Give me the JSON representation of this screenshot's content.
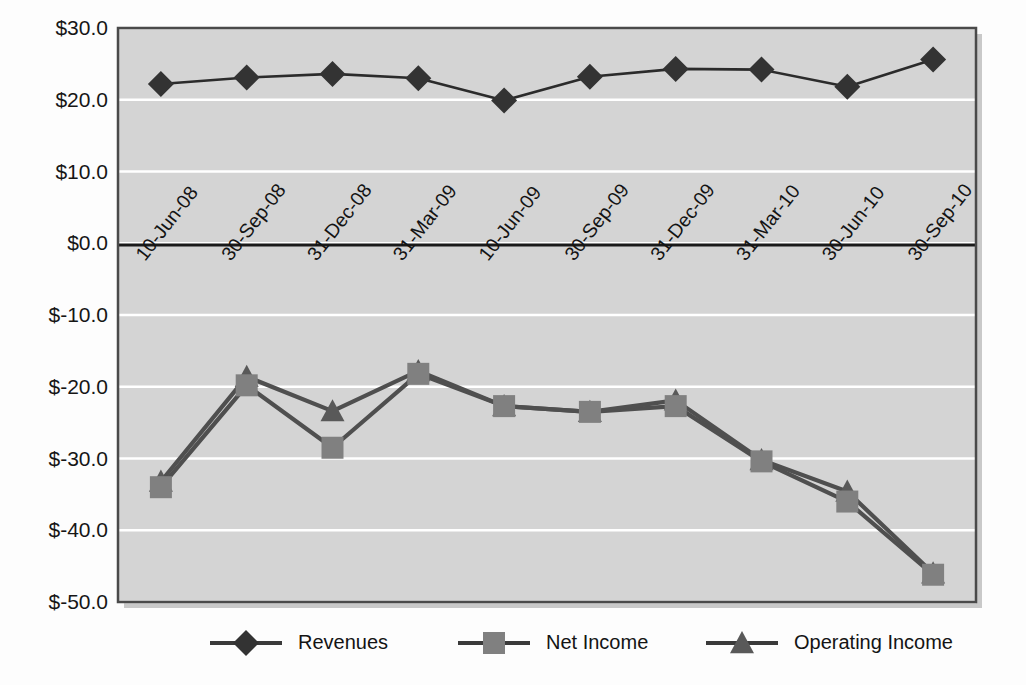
{
  "chart_data": {
    "type": "line",
    "title": "",
    "subtitle": "",
    "xlabel": "",
    "ylabel": "",
    "categories": [
      "10-Jun-08",
      "30-Sep-08",
      "31-Dec-08",
      "31-Mar-09",
      "10-Jun-09",
      "30-Sep-09",
      "31-Dec-09",
      "31-Mar-10",
      "30-Jun-10",
      "30-Sep-10"
    ],
    "series": [
      {
        "name": "Revenues",
        "marker": "diamond",
        "color": "#333333",
        "values": [
          22.2,
          23.1,
          23.6,
          23.0,
          19.9,
          23.2,
          24.3,
          24.2,
          21.8,
          25.6
        ]
      },
      {
        "name": "Net Income",
        "marker": "square",
        "color": "#808080",
        "values": [
          -34.0,
          -19.8,
          -28.5,
          -18.2,
          -22.7,
          -23.5,
          -22.7,
          -30.4,
          -36.0,
          -46.2
        ]
      },
      {
        "name": "Operating Income",
        "marker": "triangle",
        "color": "#595959",
        "values": [
          -33.2,
          -18.6,
          -23.4,
          -17.8,
          -22.7,
          -23.5,
          -21.9,
          -30.2,
          -34.6,
          -46.0
        ]
      }
    ],
    "ylim": [
      -50.0,
      30.0
    ],
    "ytick_values": [
      30.0,
      20.0,
      10.0,
      0.0,
      -10.0,
      -20.0,
      -30.0,
      -40.0,
      -50.0
    ],
    "ytick_labels": [
      "$30.0",
      "$20.0",
      "$10.0",
      "$0.0",
      "$-10.0",
      "$-20.0",
      "$-30.0",
      "$-40.0",
      "$-50.0"
    ],
    "grid": true,
    "gridline_color": "#ffffff",
    "plot_background": "#d4d4d4",
    "zero_axis_color": "#1a1a1a",
    "legend_position": "bottom",
    "legend": [
      {
        "label": "Revenues",
        "marker": "diamond",
        "color": "#333333"
      },
      {
        "label": "Net Income",
        "marker": "square",
        "color": "#808080"
      },
      {
        "label": "Operating Income",
        "marker": "triangle",
        "color": "#595959"
      }
    ]
  }
}
